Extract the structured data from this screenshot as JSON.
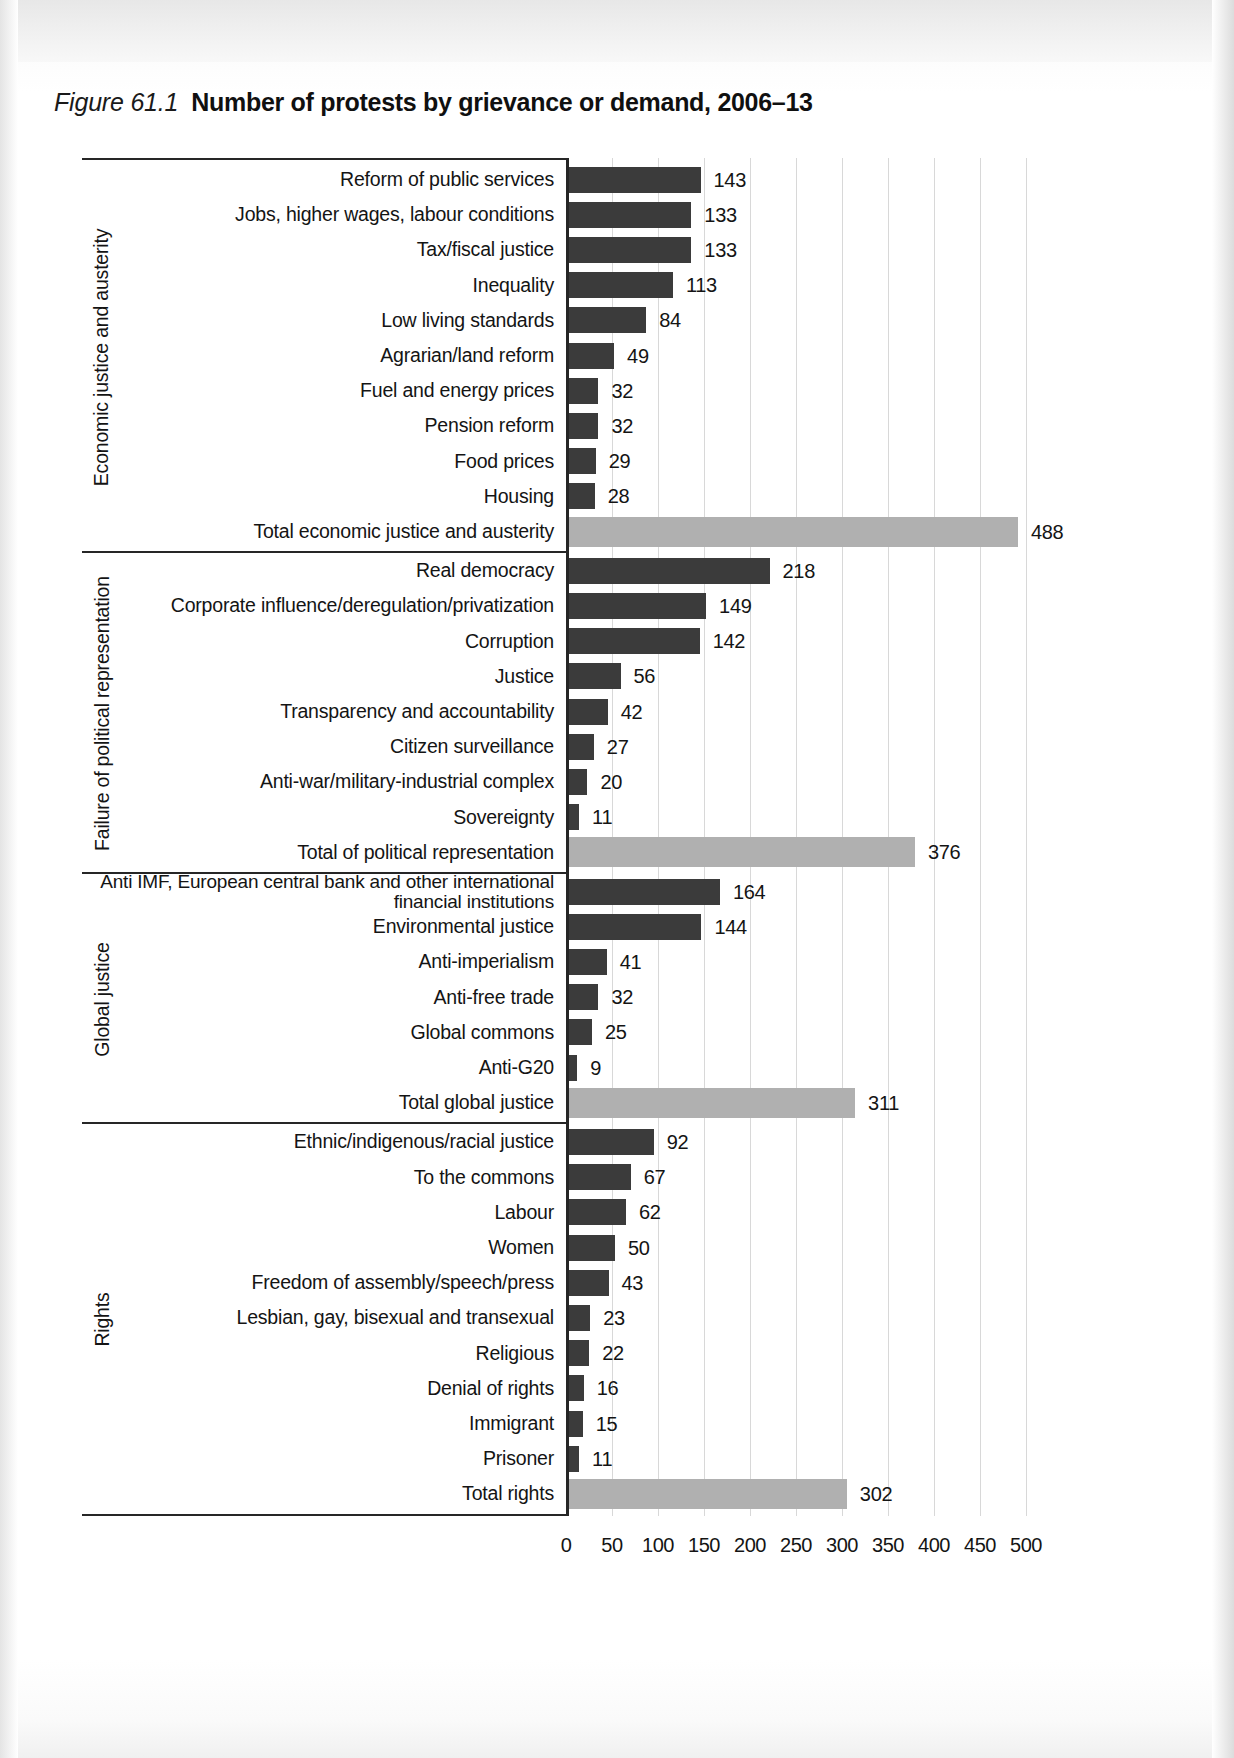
{
  "figure": {
    "number": "Figure 61.1",
    "title": "Number of protests by grievance or demand, 2006–13"
  },
  "chart_data": {
    "type": "bar",
    "orientation": "horizontal",
    "title": "Number of protests by grievance or demand, 2006–13",
    "xlabel": "",
    "ylabel": "",
    "xlim": [
      0,
      500
    ],
    "xticks": [
      0,
      50,
      100,
      150,
      200,
      250,
      300,
      350,
      400,
      450,
      500
    ],
    "grid": "vertical",
    "legend": "none",
    "colors": {
      "item_bar": "#3b3b3b",
      "total_bar": "#b0b0b0",
      "axis": "#262626",
      "gridline": "#d8d8d8"
    },
    "groups": [
      {
        "name": "Economic justice and austerity",
        "categories": [
          "Reform of public services",
          "Jobs, higher wages, labour conditions",
          "Tax/fiscal justice",
          "Inequality",
          "Low living standards",
          "Agrarian/land reform",
          "Fuel and energy prices",
          "Pension reform",
          "Food prices",
          "Housing"
        ],
        "values": [
          143,
          133,
          133,
          113,
          84,
          49,
          32,
          32,
          29,
          28
        ],
        "total_label": "Total economic justice and austerity",
        "total_value": 488
      },
      {
        "name": "Failure of political representation",
        "categories": [
          "Real democracy",
          "Corporate influence/deregulation/privatization",
          "Corruption",
          "Justice",
          "Transparency and accountability",
          "Citizen surveillance",
          "Anti-war/military-industrial complex",
          "Sovereignty"
        ],
        "values": [
          218,
          149,
          142,
          56,
          42,
          27,
          20,
          11
        ],
        "total_label": "Total of political representation",
        "total_value": 376
      },
      {
        "name": "Global justice",
        "categories": [
          "Anti IMF, European central bank and other international financial institutions",
          "Environmental justice",
          "Anti-imperialism",
          "Anti-free trade",
          "Global commons",
          "Anti-G20"
        ],
        "values": [
          164,
          144,
          41,
          32,
          25,
          9
        ],
        "total_label": "Total global justice",
        "total_value": 311
      },
      {
        "name": "Rights",
        "categories": [
          "Ethnic/indigenous/racial justice",
          "To the commons",
          "Labour",
          "Women",
          "Freedom of assembly/speech/press",
          "Lesbian, gay, bisexual and transexual",
          "Religious",
          "Denial of rights",
          "Immigrant",
          "Prisoner"
        ],
        "values": [
          92,
          67,
          62,
          50,
          43,
          23,
          22,
          16,
          15,
          11
        ],
        "total_label": "Total rights",
        "total_value": 302
      }
    ]
  }
}
